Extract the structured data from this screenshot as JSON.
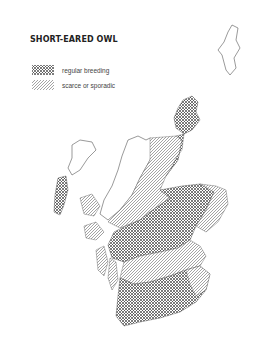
{
  "title": "SHORT-EARED OWL",
  "legend": [
    {
      "label": "regular breeding",
      "pattern": "cross-hatch"
    },
    {
      "label": "scarce or sporadic",
      "pattern": "diagonal-hatch"
    }
  ],
  "map": {
    "region": "Scotland",
    "colors": {
      "ink": "#333333",
      "background": "#ffffff"
    }
  }
}
